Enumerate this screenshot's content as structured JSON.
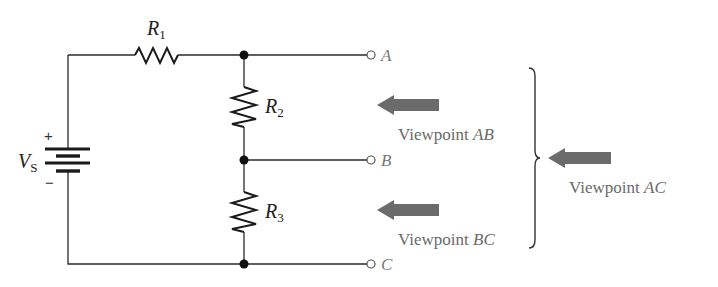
{
  "diagram": {
    "type": "voltage-divider-circuit",
    "source": {
      "label_main": "V",
      "label_sub": "S",
      "plus": "+",
      "minus": "−"
    },
    "resistors": [
      {
        "id": "R1",
        "label_main": "R",
        "label_sub": "1"
      },
      {
        "id": "R2",
        "label_main": "R",
        "label_sub": "2"
      },
      {
        "id": "R3",
        "label_main": "R",
        "label_sub": "3"
      }
    ],
    "terminals": [
      {
        "id": "A",
        "label": "A"
      },
      {
        "id": "B",
        "label": "B"
      },
      {
        "id": "C",
        "label": "C"
      }
    ],
    "viewpoints": [
      {
        "id": "AB",
        "prefix": "Viewpoint ",
        "nodes": "AB"
      },
      {
        "id": "BC",
        "prefix": "Viewpoint ",
        "nodes": "BC"
      },
      {
        "id": "AC",
        "prefix": "Viewpoint ",
        "nodes": "AC"
      }
    ],
    "colors": {
      "wire": "#2a2a2a",
      "arrow": "#6b6b6b",
      "viewpoint_text": "#6a6a6a",
      "terminal_label": "#777777"
    }
  }
}
